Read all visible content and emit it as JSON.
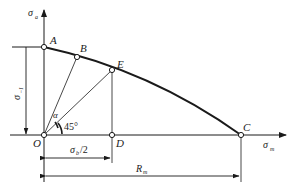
{
  "diagram": {
    "type": "fatigue-limit-diagram",
    "axes": {
      "y_axis": {
        "symbol": "σ",
        "subscript": "a"
      },
      "x_axis": {
        "symbol": "σ",
        "subscript": "m"
      }
    },
    "points": {
      "A": "A",
      "B": "B",
      "E": "E",
      "C": "C",
      "O": "O",
      "D": "D"
    },
    "angles": {
      "alpha": "α",
      "forty_five": "45°"
    },
    "dimensions": {
      "sigma_minus1": {
        "symbol": "σ",
        "subscript": "−1"
      },
      "sigma_b_half": {
        "symbol": "σ",
        "subscript": "b",
        "suffix": "/2"
      },
      "r_m": {
        "symbol": "R",
        "subscript": "m"
      }
    },
    "colors": {
      "line": "#1a1a1a",
      "thin": "#333333",
      "background": "#ffffff"
    }
  }
}
